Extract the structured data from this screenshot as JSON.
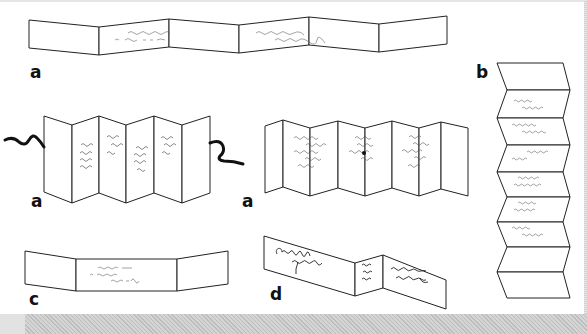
{
  "figure": {
    "colors": {
      "line": "#222222",
      "ink": "#555555",
      "cord": "#111111",
      "background": "#ffffff",
      "bottom_bar": "#c8c8c8"
    },
    "panels": [
      {
        "id": "a1",
        "label": "a",
        "form": "horizontal zig-zag strip, 4 panels, script on middle panels"
      },
      {
        "id": "a2",
        "label": "a",
        "form": "standing accordion, 6 panels, cord ends left and right"
      },
      {
        "id": "a3",
        "label": "a",
        "form": "standing accordion, 8 panels, three columns of script"
      },
      {
        "id": "b",
        "label": "b",
        "form": "vertical accordion, 8 folds, script rows"
      },
      {
        "id": "c",
        "label": "c",
        "form": "three-panel folder, script in center panel"
      },
      {
        "id": "d",
        "label": "d",
        "form": "three-panel zig-zag with large script"
      }
    ]
  }
}
